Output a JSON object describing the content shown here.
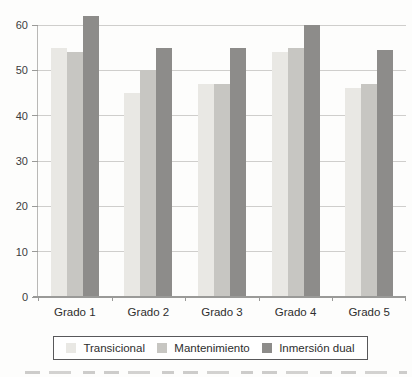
{
  "chart_data": {
    "type": "bar",
    "title": "",
    "xlabel": "",
    "ylabel": "",
    "categories": [
      "Grado 1",
      "Grado 2",
      "Grado 3",
      "Grado 4",
      "Grado 5"
    ],
    "series": [
      {
        "name": "Transicional",
        "color": "#e9e8e4",
        "values": [
          55,
          45,
          47,
          54,
          46
        ]
      },
      {
        "name": "Mantenimiento",
        "color": "#c7c6c2",
        "values": [
          54,
          50,
          47,
          55,
          47
        ]
      },
      {
        "name": "Inmersión dual",
        "color": "#8d8c8a",
        "values": [
          62,
          55,
          55,
          60,
          54.5
        ]
      }
    ],
    "ylim": [
      0,
      60
    ],
    "yticks": [
      0,
      10,
      20,
      30,
      40,
      50,
      60
    ],
    "grid": true,
    "legend_position": "bottom"
  },
  "style_colors": {
    "gridline": "#cfcecc",
    "axis": "#9a9a98",
    "tick_text": "#3c3c3c",
    "legend_border": "#58585a"
  },
  "footer": {
    "caption_cropped": true
  }
}
